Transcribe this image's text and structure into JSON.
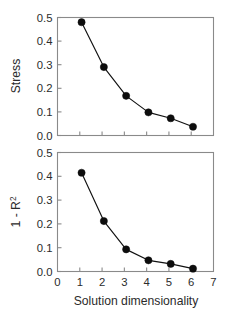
{
  "figure": {
    "background_color": "#ffffff",
    "frame_color": "#8a8a8a",
    "marker_color": "#0d0d0d",
    "line_color": "#111111"
  },
  "axis_titles": {
    "x": "Solution dimensionality",
    "y_top": "Stress",
    "y_bottom_main": "1 - R",
    "y_bottom_sup": "2"
  },
  "ticks": {
    "y_labels": [
      "0.0",
      "0.1",
      "0.2",
      "0.3",
      "0.4",
      "0.5"
    ],
    "y_values": [
      0.0,
      0.1,
      0.2,
      0.3,
      0.4,
      0.5
    ],
    "x_labels": [
      "0",
      "1",
      "2",
      "3",
      "4",
      "5",
      "6",
      "7"
    ],
    "x_values": [
      0,
      1,
      2,
      3,
      4,
      5,
      6,
      7
    ]
  },
  "chart_data": [
    {
      "type": "line",
      "title": "",
      "panel": "top",
      "xlabel": "",
      "ylabel": "Stress",
      "xlim": [
        0,
        7
      ],
      "ylim": [
        0.0,
        0.5
      ],
      "grid": false,
      "legend": "none",
      "x": [
        1.08,
        2.08,
        3.08,
        4.08,
        5.08,
        6.08
      ],
      "values": [
        0.48,
        0.29,
        0.168,
        0.098,
        0.073,
        0.037
      ],
      "xtick_labels_visible": false,
      "marker": "filled-circle"
    },
    {
      "type": "line",
      "title": "",
      "panel": "bottom",
      "xlabel": "Solution dimensionality",
      "ylabel": "1 - R2",
      "xlim": [
        0,
        7
      ],
      "ylim": [
        0.0,
        0.5
      ],
      "grid": false,
      "legend": "none",
      "x": [
        1.08,
        2.08,
        3.08,
        4.08,
        5.08,
        6.08
      ],
      "values": [
        0.415,
        0.212,
        0.093,
        0.047,
        0.032,
        0.012
      ],
      "xtick_labels_visible": true,
      "marker": "filled-circle"
    }
  ]
}
